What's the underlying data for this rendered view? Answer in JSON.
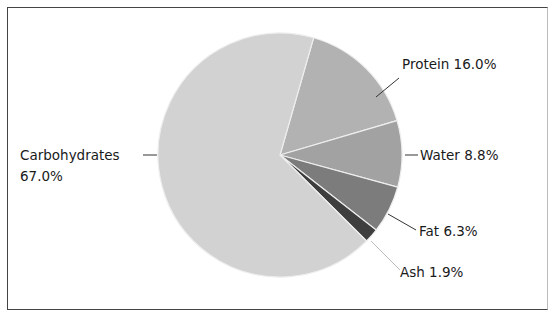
{
  "chart_data": {
    "type": "pie",
    "title": "",
    "categories": [
      "Protein",
      "Water",
      "Fat",
      "Ash",
      "Carbohydrates"
    ],
    "values": [
      16.0,
      8.8,
      6.3,
      1.9,
      67.0
    ],
    "unit": "%",
    "start_angle_deg": 16,
    "direction": "clockwise",
    "colors": [
      "#b2b2b2",
      "#a2a2a2",
      "#7c7c7c",
      "#3e3e3e",
      "#d2d2d2"
    ],
    "slice_separator_color": "#eeeeee",
    "legend": "none (direct labels with leader lines)",
    "labels": [
      {
        "name": "Protein",
        "text": "Protein 16.0%"
      },
      {
        "name": "Water",
        "text": "Water 8.8%"
      },
      {
        "name": "Fat",
        "text": "Fat 6.3%"
      },
      {
        "name": "Ash",
        "text": "Ash 1.9%"
      },
      {
        "name": "Carbohydrates",
        "line1": "Carbohydrates",
        "line2": "67.0%"
      }
    ]
  }
}
